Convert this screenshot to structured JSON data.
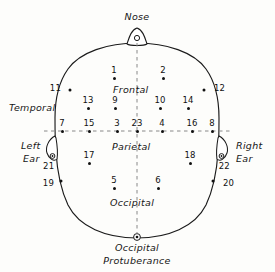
{
  "diagram": {
    "type": "head-map",
    "ink_color": "#111111",
    "paper_color": "#fdfdfb"
  },
  "anatomical_labels": {
    "nose": "Nose",
    "occipital_protuberance_line1": "Occipital",
    "occipital_protuberance_line2": "Protuberance",
    "temporal": "Temporal",
    "left_ear_line1": "Left",
    "left_ear_line2": "Ear",
    "right_ear_line1": "Right",
    "right_ear_line2": "Ear"
  },
  "region_labels": {
    "frontal": "Frontal",
    "parietal": "Parietal",
    "occipital": "Occipital"
  },
  "electrodes": [
    {
      "num": "1",
      "x": 114,
      "y": 78,
      "pos": "above"
    },
    {
      "num": "2",
      "x": 163,
      "y": 78,
      "pos": "above"
    },
    {
      "num": "13",
      "x": 88,
      "y": 108,
      "pos": "above"
    },
    {
      "num": "9",
      "x": 115,
      "y": 108,
      "pos": "above"
    },
    {
      "num": "10",
      "x": 160,
      "y": 108,
      "pos": "above"
    },
    {
      "num": "14",
      "x": 188,
      "y": 108,
      "pos": "above"
    },
    {
      "num": "7",
      "x": 62,
      "y": 131,
      "pos": "above"
    },
    {
      "num": "15",
      "x": 89,
      "y": 131,
      "pos": "above"
    },
    {
      "num": "3",
      "x": 117,
      "y": 131,
      "pos": "above"
    },
    {
      "num": "23",
      "x": 137,
      "y": 131,
      "pos": "above"
    },
    {
      "num": "4",
      "x": 162,
      "y": 131,
      "pos": "above"
    },
    {
      "num": "16",
      "x": 192,
      "y": 131,
      "pos": "above"
    },
    {
      "num": "8",
      "x": 212,
      "y": 131,
      "pos": "above"
    },
    {
      "num": "17",
      "x": 89,
      "y": 163,
      "pos": "above"
    },
    {
      "num": "18",
      "x": 190,
      "y": 163,
      "pos": "above"
    },
    {
      "num": "5",
      "x": 114,
      "y": 188,
      "pos": "above"
    },
    {
      "num": "6",
      "x": 158,
      "y": 188,
      "pos": "above"
    },
    {
      "num": "11",
      "x": 65,
      "y": 88,
      "pos": "side-left"
    },
    {
      "num": "12",
      "x": 210,
      "y": 88,
      "pos": "side-right"
    },
    {
      "num": "21",
      "x": 54,
      "y": 158,
      "pos": "below-left"
    },
    {
      "num": "22",
      "x": 219,
      "y": 158,
      "pos": "below-right"
    },
    {
      "num": "19",
      "x": 58,
      "y": 183,
      "pos": "side-left"
    },
    {
      "num": "20",
      "x": 219,
      "y": 183,
      "pos": "side-right"
    }
  ],
  "guides": {
    "midline_axis": "vertical dashed midline from nose to occipital protuberance",
    "coronal_axis": "horizontal dashed line through ear level"
  }
}
